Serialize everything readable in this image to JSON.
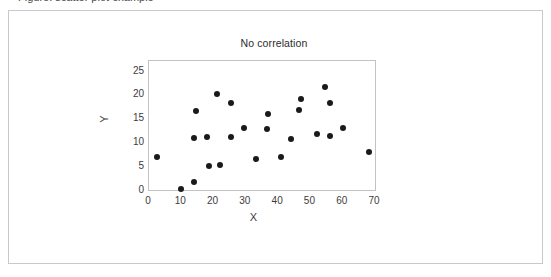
{
  "top_clipped_text": "Figure: scatter plot example",
  "card": {
    "border_color": "#c9c9c9",
    "background": "#ffffff"
  },
  "chart_data": {
    "type": "scatter",
    "title": "No correlation",
    "xlabel": "X",
    "ylabel": "Y",
    "xlim": [
      0,
      70
    ],
    "ylim": [
      0,
      27
    ],
    "xticks": [
      0,
      10,
      20,
      30,
      40,
      50,
      60,
      70
    ],
    "yticks": [
      0,
      5,
      10,
      15,
      20,
      25
    ],
    "grid": false,
    "legend": null,
    "marker_color": "#1a1a1a",
    "marker_size": 6,
    "points": [
      {
        "x": 2.5,
        "y": 7.0
      },
      {
        "x": 10.0,
        "y": 0.2
      },
      {
        "x": 14.0,
        "y": 1.7
      },
      {
        "x": 14.0,
        "y": 10.8
      },
      {
        "x": 14.5,
        "y": 16.5
      },
      {
        "x": 18.0,
        "y": 11.0
      },
      {
        "x": 18.5,
        "y": 5.0
      },
      {
        "x": 21.0,
        "y": 20.0
      },
      {
        "x": 22.0,
        "y": 5.2
      },
      {
        "x": 25.5,
        "y": 11.0
      },
      {
        "x": 25.5,
        "y": 18.2
      },
      {
        "x": 29.5,
        "y": 13.0
      },
      {
        "x": 33.0,
        "y": 6.4
      },
      {
        "x": 36.5,
        "y": 12.7
      },
      {
        "x": 37.0,
        "y": 16.0
      },
      {
        "x": 41.0,
        "y": 7.0
      },
      {
        "x": 44.0,
        "y": 10.7
      },
      {
        "x": 46.5,
        "y": 16.8
      },
      {
        "x": 47.0,
        "y": 19.0
      },
      {
        "x": 52.0,
        "y": 11.7
      },
      {
        "x": 54.5,
        "y": 21.5
      },
      {
        "x": 56.0,
        "y": 18.2
      },
      {
        "x": 56.0,
        "y": 11.2
      },
      {
        "x": 60.0,
        "y": 13.0
      },
      {
        "x": 68.0,
        "y": 8.0
      }
    ]
  }
}
